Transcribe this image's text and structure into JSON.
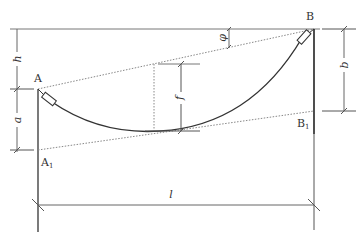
{
  "diagram": {
    "type": "cable-sag-diagram",
    "points": {
      "A": "A",
      "B": "B",
      "A1": {
        "base": "A",
        "sub": "1"
      },
      "B1": {
        "base": "B",
        "sub": "1"
      }
    },
    "dimensions": {
      "h": "h",
      "a": "a",
      "b": "b",
      "f": "f",
      "l": "l",
      "phi": "φ"
    },
    "colors": {
      "line": "#333333",
      "dotted": "#888888",
      "background": "#ffffff"
    }
  }
}
